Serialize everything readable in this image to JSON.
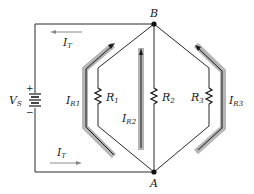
{
  "diagram": {
    "type": "parallel-circuit",
    "nodes": {
      "top": {
        "label": "B"
      },
      "bottom": {
        "label": "A"
      }
    },
    "source": {
      "label_main": "V",
      "label_sub": "S",
      "plus": "+",
      "minus": "−"
    },
    "total_current": {
      "top": {
        "main": "I",
        "sub": "T",
        "direction": "left"
      },
      "bottom": {
        "main": "I",
        "sub": "T",
        "direction": "right"
      }
    },
    "resistors": [
      {
        "main": "R",
        "sub": "1"
      },
      {
        "main": "R",
        "sub": "2"
      },
      {
        "main": "R",
        "sub": "3"
      }
    ],
    "branch_currents": [
      {
        "main": "I",
        "sub": "R1",
        "direction": "up"
      },
      {
        "main": "I",
        "sub": "R2",
        "direction": "up"
      },
      {
        "main": "I",
        "sub": "R3",
        "direction": "up"
      }
    ],
    "colors": {
      "wire": "#2a2a2a",
      "current_band": "#b5b5b5",
      "arrow": "#1a1a1a",
      "total_arrow": "#8a8a8a"
    }
  }
}
